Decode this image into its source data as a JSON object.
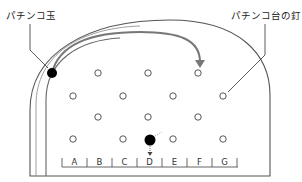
{
  "labels": {
    "ball": "パチンコ玉",
    "pin": "パチンコ台の釘"
  },
  "slots": [
    "A",
    "B",
    "C",
    "D",
    "E",
    "F",
    "G"
  ],
  "colors": {
    "line": "#555555",
    "track": "#777777",
    "ball": "#000000",
    "arrow": "#666666"
  },
  "pins": [
    [
      98,
      73
    ],
    [
      148,
      73
    ],
    [
      198,
      73
    ],
    [
      73,
      96
    ],
    [
      123,
      96
    ],
    [
      173,
      96
    ],
    [
      223,
      96
    ],
    [
      98,
      117
    ],
    [
      148,
      117
    ],
    [
      198,
      117
    ],
    [
      73,
      139
    ],
    [
      123,
      139
    ],
    [
      173,
      139
    ],
    [
      223,
      139
    ]
  ],
  "balls": [
    {
      "name": "launch-ball",
      "x": 52,
      "y": 73
    },
    {
      "name": "falling-ball",
      "x": 148,
      "y": 139
    }
  ]
}
